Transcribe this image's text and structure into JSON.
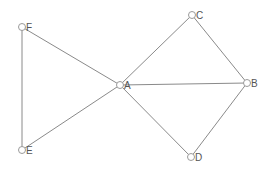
{
  "graph": {
    "nodes": [
      {
        "id": "A",
        "label": "A",
        "x": 120,
        "y": 85
      },
      {
        "id": "B",
        "label": "B",
        "x": 247,
        "y": 83
      },
      {
        "id": "C",
        "label": "C",
        "x": 192,
        "y": 15
      },
      {
        "id": "D",
        "label": "D",
        "x": 191,
        "y": 157
      },
      {
        "id": "E",
        "label": "E",
        "x": 22,
        "y": 150
      },
      {
        "id": "F",
        "label": "F",
        "x": 22,
        "y": 27
      }
    ],
    "edges": [
      {
        "from": "F",
        "to": "A"
      },
      {
        "from": "F",
        "to": "E"
      },
      {
        "from": "E",
        "to": "A"
      },
      {
        "from": "A",
        "to": "C"
      },
      {
        "from": "A",
        "to": "B"
      },
      {
        "from": "A",
        "to": "D"
      },
      {
        "from": "C",
        "to": "B"
      },
      {
        "from": "D",
        "to": "B"
      }
    ],
    "colors": {
      "edge": "#8a8a8a",
      "node_stroke": "#9a9a9a",
      "label": "#555555"
    }
  }
}
